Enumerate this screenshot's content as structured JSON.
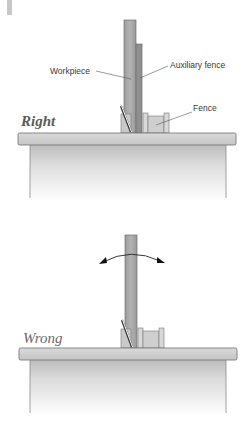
{
  "diagram": {
    "panels": [
      {
        "id": "right",
        "title": "Right",
        "labels": {
          "workpiece": "Workpiece",
          "auxiliary_fence": "Auxiliary fence",
          "fence": "Fence"
        }
      },
      {
        "id": "wrong",
        "title": "Wrong",
        "annotation": "rocking-arrow"
      }
    ],
    "colors": {
      "wood": "#a9a9a9",
      "wood_dark": "#8e8e8e",
      "fence": "#d6d6d6",
      "table_top": "#cfcfcf",
      "table_body": "#e2e2e2",
      "outline": "#6b6b6b",
      "marker": "#c8c8c8"
    }
  }
}
